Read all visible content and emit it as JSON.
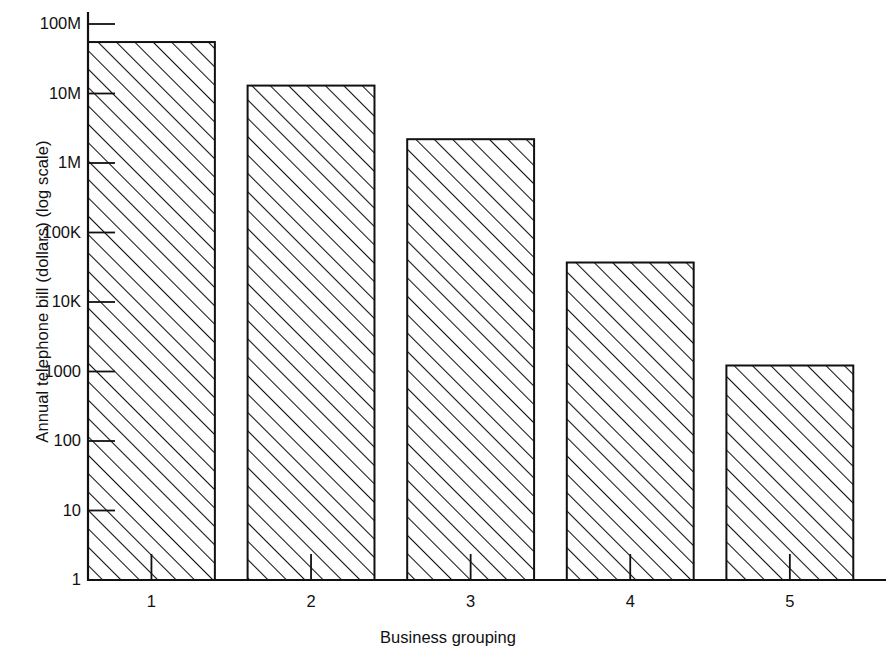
{
  "chart_data": {
    "type": "bar",
    "title": "",
    "xlabel": "Business grouping",
    "ylabel": "Annual telephone bill (dollars) (log scale)",
    "categories": [
      "1",
      "2",
      "3",
      "4",
      "5"
    ],
    "values": [
      55000000,
      13000000,
      2200000,
      37000000000000000000000000000000000000000000,
      1220
    ],
    "values_readable": [
      "55M",
      "13M",
      "2.2M",
      "37K",
      "1220"
    ],
    "series": [
      {
        "name": "Annual telephone bill",
        "values": [
          55000000,
          13000000,
          2200000,
          37000,
          1220
        ]
      }
    ],
    "yscale": "log",
    "ylim": [
      1,
      100000000
    ],
    "y_ticks": [
      1,
      10,
      100,
      1000,
      10000,
      100000,
      1000000,
      10000000,
      100000000
    ],
    "y_tick_labels": [
      "1",
      "10",
      "100",
      "1000",
      "10K",
      "100K",
      "1M",
      "10M",
      "100M"
    ],
    "x_tick_labels": [
      "1",
      "2",
      "3",
      "4",
      "5"
    ],
    "grid": false,
    "legend": false,
    "legend_position": "none",
    "bar_fill": "diagonal-hatch",
    "bar_edge_color": "#111111",
    "background_color": "#ffffff"
  },
  "axes": {
    "y_title": "Annual telephone bill (dollars) (log scale)",
    "x_title": "Business grouping"
  }
}
